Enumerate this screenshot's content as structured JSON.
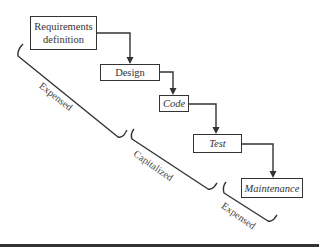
{
  "diagram": {
    "type": "waterfall-process",
    "stages": [
      {
        "id": "requirements",
        "label_line1": "Requirements",
        "label_line2": "definition",
        "style": "normal"
      },
      {
        "id": "design",
        "label": "Design",
        "style": "normal"
      },
      {
        "id": "code",
        "label": "Code",
        "style": "italic"
      },
      {
        "id": "test",
        "label": "Test",
        "style": "italic"
      },
      {
        "id": "maintenance",
        "label": "Maintenance",
        "style": "italic"
      }
    ],
    "flows": [
      {
        "from": "requirements",
        "to": "design"
      },
      {
        "from": "design",
        "to": "code"
      },
      {
        "from": "code",
        "to": "test"
      },
      {
        "from": "test",
        "to": "maintenance"
      }
    ],
    "braces": [
      {
        "label": "Expensed",
        "covers": [
          "requirements",
          "design"
        ]
      },
      {
        "label": "Capitalized",
        "covers": [
          "code",
          "test"
        ]
      },
      {
        "label": "Expensed",
        "covers": [
          "maintenance"
        ]
      }
    ],
    "colors": {
      "line": "#333333",
      "text": "#333333",
      "background": "#ffffff"
    }
  }
}
